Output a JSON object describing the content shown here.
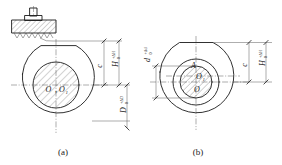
{
  "drawing": {
    "title": "Eccentric bore workpiece clamping diagram",
    "line_color": "#1a1a1a",
    "thin_color": "#4a4a4a"
  },
  "figures": [
    {
      "id": "a",
      "caption": "(a)",
      "center_label": "O, O₁",
      "center_label_main": "O",
      "center_label_sub": "O",
      "center_label_sub_index": "1",
      "dimensions": [
        {
          "name": "c",
          "symbol": "c",
          "tolerance_upper": "",
          "tolerance_lower": "",
          "orientation": "vertical"
        },
        {
          "name": "H",
          "symbol": "H",
          "tolerance_upper": "+ΔH",
          "tolerance_lower": "0",
          "orientation": "vertical"
        },
        {
          "name": "D",
          "symbol": "D",
          "tolerance_upper": "+ΔD",
          "tolerance_lower": "0",
          "orientation": "vertical"
        }
      ],
      "has_clamp": true,
      "clamp": {
        "name": "v-block-clamp",
        "hatched": true,
        "bolt": true,
        "serrated_face": true
      }
    },
    {
      "id": "b",
      "caption": "(b)",
      "point_label_A": "A",
      "center_label_upper": "O₁",
      "center_label_upper_main": "O",
      "center_label_upper_index": "1",
      "center_label_lower": "O",
      "dimensions": [
        {
          "name": "c",
          "symbol": "c",
          "tolerance_upper": "",
          "tolerance_lower": "",
          "orientation": "vertical"
        },
        {
          "name": "H",
          "symbol": "H",
          "tolerance_upper": "+ΔH",
          "tolerance_lower": "0",
          "orientation": "vertical"
        },
        {
          "name": "d",
          "symbol": "d",
          "tolerance_upper": "+Δd",
          "tolerance_lower": "0",
          "orientation": "vertical"
        }
      ],
      "has_clamp": false
    }
  ]
}
